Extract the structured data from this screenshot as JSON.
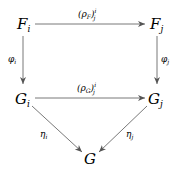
{
  "diagram": {
    "type": "commutative-diagram",
    "nodes": {
      "Fi": {
        "main": "F",
        "sub": "i"
      },
      "Fj": {
        "main": "F",
        "sub": "j"
      },
      "Gi": {
        "main": "G",
        "sub": "i"
      },
      "Gj": {
        "main": "G",
        "sub": "j"
      },
      "G": {
        "main": "G"
      }
    },
    "arrows": {
      "top": {
        "from": "Fi",
        "to": "Fj",
        "label_open": "(ρ",
        "label_sub": "F",
        "label_close": ")",
        "label_sup": "i",
        "label_sub2": "j"
      },
      "middle": {
        "from": "Gi",
        "to": "Gj",
        "label_open": "(ρ",
        "label_sub": "G",
        "label_close": ")",
        "label_sup": "i",
        "label_sub2": "j"
      },
      "left": {
        "from": "Fi",
        "to": "Gi",
        "label": "φ",
        "label_sub": "i"
      },
      "right": {
        "from": "Fj",
        "to": "Gj",
        "label": "φ",
        "label_sub": "j"
      },
      "diag_left": {
        "from": "Gi",
        "to": "G",
        "label": "η",
        "label_sub": "i"
      },
      "diag_right": {
        "from": "Gj",
        "to": "G",
        "label": "η",
        "label_sub": "j"
      }
    },
    "stroke_color": "#555555"
  }
}
